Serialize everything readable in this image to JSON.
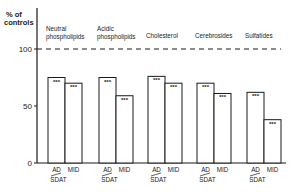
{
  "chart_data": {
    "type": "bar",
    "title": "",
    "ylabel": "% of controls",
    "xlabel": "",
    "ylim": [
      0,
      100
    ],
    "yticks": [
      0,
      50,
      100
    ],
    "reference_line": {
      "value": 100,
      "style": "dashed"
    },
    "grid": false,
    "legend": null,
    "categories": [
      "Neutral phospholipids",
      "Acidic phospholipids",
      "Cholesterol",
      "Cerebrosides",
      "Sulfatides"
    ],
    "category_labels": [
      [
        "Neutral",
        "phospholipids"
      ],
      [
        "Acidic",
        "phospholipids"
      ],
      [
        "Cholesterol"
      ],
      [
        "Cerebrosides"
      ],
      [
        "Sulfatides"
      ]
    ],
    "series": [
      {
        "name": "AD/SDAT",
        "label_top": "AD",
        "label_bottom": "SDAT",
        "values": [
          75,
          75,
          76,
          70,
          62
        ],
        "significance": [
          "***",
          "***",
          "***",
          "***",
          "***"
        ]
      },
      {
        "name": "MID",
        "label_top": "MID",
        "label_bottom": "",
        "values": [
          70,
          59,
          70,
          61,
          38
        ],
        "significance": [
          "***",
          "***",
          "***",
          "***",
          "***"
        ]
      }
    ],
    "annotations": [
      "*** significance markers inside top of each bar"
    ]
  }
}
